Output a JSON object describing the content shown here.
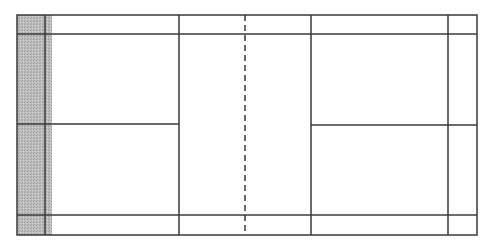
{
  "diagram": {
    "type": "court-layout",
    "colors": {
      "line": "#3a3a3a",
      "shade": "#b4b4b4",
      "background": "#ffffff"
    },
    "court": {
      "x1": 17,
      "y1": 15,
      "x2": 477,
      "y2": 235
    },
    "shaded_region": {
      "x1": 17,
      "y1": 15,
      "x2": 52,
      "y2": 235,
      "label": "shaded-area"
    },
    "horizontal_lines": [
      {
        "name": "side-line-top-inner",
        "y": 34,
        "x1": 17,
        "x2": 477,
        "dashed": false
      },
      {
        "name": "center-line-left",
        "y": 124,
        "x1": 17,
        "x2": 179,
        "dashed": false
      },
      {
        "name": "center-line-right",
        "y": 125,
        "x1": 311,
        "x2": 477,
        "dashed": false
      },
      {
        "name": "side-line-bottom-inner",
        "y": 215,
        "x1": 17,
        "x2": 477,
        "dashed": false
      }
    ],
    "vertical_lines": [
      {
        "name": "back-service-line-left",
        "x": 45,
        "y1": 15,
        "y2": 235,
        "dashed": false
      },
      {
        "name": "short-service-line-left",
        "x": 179,
        "y1": 15,
        "y2": 235,
        "dashed": false
      },
      {
        "name": "net",
        "x": 245,
        "y1": 15,
        "y2": 235,
        "dashed": true
      },
      {
        "name": "short-service-line-right",
        "x": 311,
        "y1": 15,
        "y2": 235,
        "dashed": false
      },
      {
        "name": "back-service-line-right",
        "x": 448,
        "y1": 15,
        "y2": 235,
        "dashed": false
      }
    ],
    "caption": ""
  }
}
